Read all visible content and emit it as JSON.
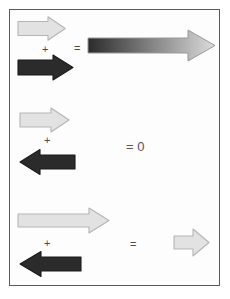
{
  "figure": {
    "background_color": "#ffffff",
    "frame_border_color": "#5a5a5a",
    "colors": {
      "light_arrow_fill": "#e2e2e2",
      "light_arrow_stroke": "#b5b5b5",
      "dark_arrow_fill": "#2b2b2b",
      "dark_arrow_stroke": "#1a1a1a",
      "gradient_start": "#2b2b2b",
      "gradient_end": "#dcdcdc",
      "operator_color": "#4a4a4a"
    }
  },
  "rows": [
    {
      "id": "row-1",
      "description": "Two arrows pointing right add to a longer arrow",
      "operands": [
        {
          "name": "light-arrow-right",
          "direction": "right",
          "shade": "light"
        },
        {
          "name": "dark-arrow-right",
          "direction": "right",
          "shade": "dark"
        }
      ],
      "plus_label": "+",
      "equals_label": "=",
      "result": {
        "name": "gradient-arrow-right",
        "direction": "right",
        "shade": "gradient",
        "label": ""
      }
    },
    {
      "id": "row-2",
      "description": "Equal and opposite arrows cancel to zero",
      "operands": [
        {
          "name": "light-arrow-right",
          "direction": "right",
          "shade": "light"
        },
        {
          "name": "dark-arrow-left",
          "direction": "left",
          "shade": "dark"
        }
      ],
      "plus_label": "+",
      "equals_label": "=",
      "result": {
        "name": "zero-result",
        "direction": "none",
        "shade": "none",
        "label": "= 0"
      }
    },
    {
      "id": "row-3",
      "description": "Longer right arrow plus shorter left arrow gives a short right arrow",
      "operands": [
        {
          "name": "light-arrow-right",
          "direction": "right",
          "shade": "light"
        },
        {
          "name": "dark-arrow-left",
          "direction": "left",
          "shade": "dark"
        }
      ],
      "plus_label": "+",
      "equals_label": "=",
      "result": {
        "name": "light-arrow-right-short",
        "direction": "right",
        "shade": "light",
        "label": ""
      }
    }
  ]
}
